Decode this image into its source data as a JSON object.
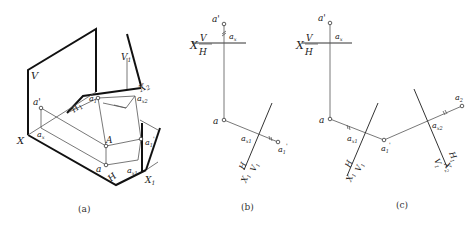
{
  "figure": {
    "panels": [
      {
        "id": "a",
        "caption": "(a)",
        "labels": {
          "V": "V",
          "V1": "V",
          "V1_sub": "1",
          "X": "X",
          "X1": "X",
          "X1_sub": "1",
          "X2": "X",
          "X2_sub": "2",
          "H": "H",
          "H1": "H",
          "H1_sub": "1",
          "a_prime": "a'",
          "a_x": "a",
          "a_x_sub": "x",
          "a1": "a",
          "a1_sub": "1",
          "a_x2": "a",
          "a_x2_sub": "x2",
          "A": "A",
          "a1_prime": "a",
          "a1_prime_sub": "1",
          "a1_prime_sup": "'",
          "a": "a",
          "a_x1": "a",
          "a_x1_sub": "x1"
        }
      },
      {
        "id": "b",
        "caption": "(b)",
        "labels": {
          "a_prime": "a'",
          "a_x": "a",
          "a_x_sub": "x",
          "X": "X",
          "V": "V",
          "H": "H",
          "a": "a",
          "a_x1": "a",
          "a_x1_sub": "x1",
          "a1_prime": "a",
          "a1_prime_sub": "1",
          "a1_prime_sup": "'",
          "H_axis": "H",
          "V1_axis": "V",
          "V1_sub": "1",
          "X1_axis": "X",
          "X1_sub": "1"
        }
      },
      {
        "id": "c",
        "caption": "(c)",
        "labels": {
          "a_prime": "a'",
          "a_x": "a",
          "a_x_sub": "x",
          "X": "X",
          "V": "V",
          "H": "H",
          "a": "a",
          "a_x1": "a",
          "a_x1_sub": "x1",
          "a1_prime": "a",
          "a1_prime_sub": "1",
          "a1_prime_sup": "'",
          "H_axis1": "H",
          "V1_axis1": "V",
          "V1_sub": "1",
          "X1_axis": "X",
          "X1_sub": "1",
          "a_x2": "a",
          "a_x2_sub": "x2",
          "a2": "a",
          "a2_sub": "2",
          "H1_axis2": "H",
          "H1_sub": "1",
          "V1_axis2": "V",
          "V1b_sub": "1",
          "X2_axis": "X",
          "X2_sub": "2"
        }
      }
    ]
  }
}
